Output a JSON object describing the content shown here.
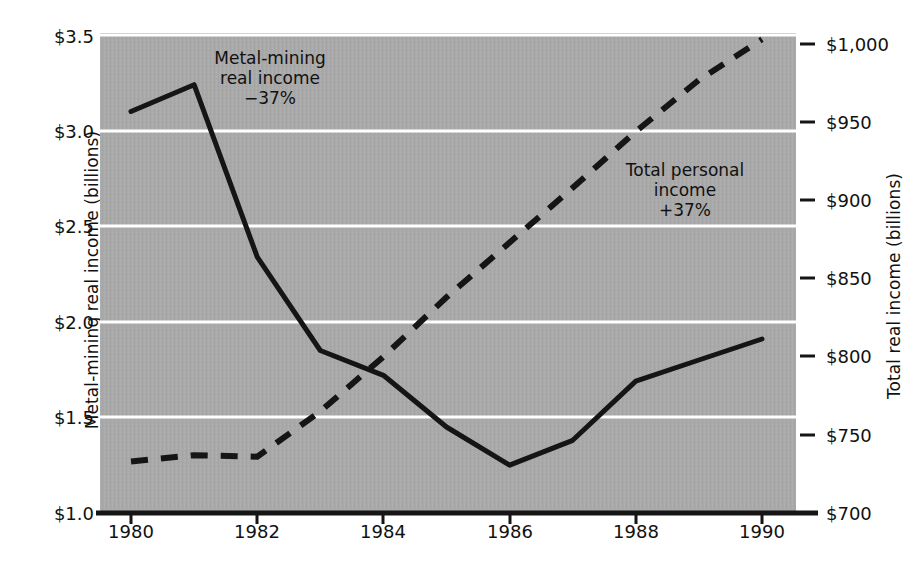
{
  "chart_data": {
    "type": "line",
    "title": "",
    "x": [
      1980,
      1981,
      1982,
      1983,
      1984,
      1985,
      1986,
      1987,
      1988,
      1989,
      1990
    ],
    "series": [
      {
        "name": "Metal-mining real income",
        "axis": "left",
        "style": "solid",
        "color": "#151515",
        "values": [
          3.1,
          3.24,
          2.34,
          1.85,
          1.72,
          1.45,
          1.25,
          1.38,
          1.69,
          1.8,
          1.91
        ]
      },
      {
        "name": "Total personal income",
        "axis": "right",
        "style": "dashed",
        "color": "#151515",
        "values": [
          733,
          737,
          736,
          765,
          800,
          838,
          873,
          908,
          944,
          977,
          1003
        ]
      }
    ],
    "left_axis": {
      "label": "Metal-mining real income (billions)",
      "ticks": [
        "$1.0",
        "$1.5",
        "$2.0",
        "$2.5",
        "$3.0",
        "$3.5"
      ],
      "tick_values": [
        1.0,
        1.5,
        2.0,
        2.5,
        3.0,
        3.5
      ],
      "ylim": [
        1.0,
        3.5
      ]
    },
    "right_axis": {
      "label": "Total real income (billions)",
      "ticks": [
        "$700",
        "$750",
        "$800",
        "$850",
        "$900",
        "$950",
        "$1,000"
      ],
      "tick_values": [
        700,
        750,
        800,
        850,
        900,
        950,
        1000
      ],
      "ylim": [
        700,
        1000
      ]
    },
    "x_axis": {
      "label": "",
      "ticks": [
        "1980",
        "1982",
        "1984",
        "1986",
        "1988",
        "1990"
      ],
      "tick_values": [
        1980,
        1982,
        1984,
        1986,
        1988,
        1990
      ],
      "xlim": [
        1979.5,
        1990.6
      ]
    },
    "annotations": [
      {
        "id": "metal",
        "lines": [
          "Metal-mining",
          "real income",
          "−37%"
        ]
      },
      {
        "id": "total",
        "lines": [
          "Total personal",
          "income",
          "+37%"
        ]
      }
    ],
    "grid": "horizontal-white",
    "plot_background": "#a9a9a9",
    "legend_position": "inline-annotations"
  }
}
